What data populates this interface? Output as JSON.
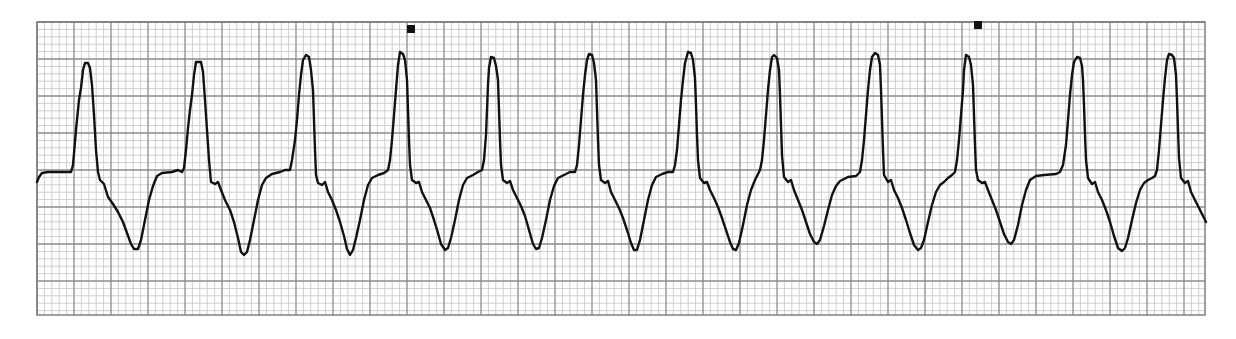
{
  "chart_data": {
    "type": "line",
    "title": "",
    "subtitle": "",
    "xlabel": "",
    "ylabel": "",
    "grid": {
      "on": true,
      "x0": 37,
      "y0": 22,
      "x1": 1205,
      "y1": 315,
      "minor_px": 7.4,
      "major_px": 37,
      "minor_color": "#c4c4c4",
      "major_color": "#8c8c8c",
      "border_color": "#777777"
    },
    "trace_color": "#111111",
    "trace_width": 2.4,
    "markers": [
      {
        "x": 411,
        "y": 29,
        "label": "event-marker-1"
      },
      {
        "x": 978,
        "y": 25,
        "label": "event-marker-2"
      }
    ],
    "complexes": [
      {
        "index": 1,
        "peak": [
          86,
          63
        ],
        "trough": [
          134,
          250
        ]
      },
      {
        "index": 2,
        "peak": [
          198,
          62
        ],
        "trough": [
          243,
          255
        ]
      },
      {
        "index": 3,
        "peak": [
          306,
          55
        ],
        "trough": [
          350,
          255
        ]
      },
      {
        "index": 4,
        "peak": [
          400,
          52
        ],
        "trough": [
          446,
          250
        ]
      },
      {
        "index": 5,
        "peak": [
          490,
          57
        ],
        "trough": [
          537,
          250
        ]
      },
      {
        "index": 6,
        "peak": [
          589,
          54
        ],
        "trough": [
          635,
          251
        ]
      },
      {
        "index": 7,
        "peak": [
          689,
          52
        ],
        "trough": [
          735,
          250
        ]
      },
      {
        "index": 8,
        "peak": [
          773,
          55
        ],
        "trough": [
          817,
          244
        ]
      },
      {
        "index": 9,
        "peak": [
          874,
          53
        ],
        "trough": [
          918,
          250
        ]
      },
      {
        "index": 10,
        "peak": [
          966,
          55
        ],
        "trough": [
          1010,
          244
        ]
      },
      {
        "index": 11,
        "peak": [
          1076,
          57
        ],
        "trough": [
          1122,
          251
        ]
      },
      {
        "index": 12,
        "peak": [
          1169,
          54
        ],
        "trough": null
      }
    ],
    "points": [
      [
        37,
        182
      ],
      [
        39,
        177
      ],
      [
        42,
        173
      ],
      [
        48,
        172
      ],
      [
        71,
        172
      ],
      [
        73,
        165
      ],
      [
        76,
        130
      ],
      [
        79,
        100
      ],
      [
        81,
        88
      ],
      [
        83,
        70
      ],
      [
        85,
        63
      ],
      [
        88,
        63
      ],
      [
        90,
        68
      ],
      [
        92,
        85
      ],
      [
        94,
        115
      ],
      [
        96,
        150
      ],
      [
        98,
        172
      ],
      [
        100,
        180
      ],
      [
        104,
        184
      ],
      [
        108,
        197
      ],
      [
        113,
        204
      ],
      [
        118,
        212
      ],
      [
        123,
        222
      ],
      [
        127,
        233
      ],
      [
        131,
        244
      ],
      [
        134,
        249
      ],
      [
        138,
        249
      ],
      [
        141,
        240
      ],
      [
        145,
        220
      ],
      [
        149,
        200
      ],
      [
        153,
        186
      ],
      [
        157,
        176
      ],
      [
        162,
        173
      ],
      [
        172,
        172
      ],
      [
        178,
        170
      ],
      [
        182,
        172
      ],
      [
        184,
        168
      ],
      [
        186,
        150
      ],
      [
        188,
        128
      ],
      [
        190,
        110
      ],
      [
        192,
        95
      ],
      [
        194,
        75
      ],
      [
        196,
        62
      ],
      [
        201,
        62
      ],
      [
        203,
        72
      ],
      [
        205,
        100
      ],
      [
        207,
        130
      ],
      [
        209,
        160
      ],
      [
        211,
        182
      ],
      [
        215,
        184
      ],
      [
        218,
        182
      ],
      [
        221,
        190
      ],
      [
        225,
        200
      ],
      [
        230,
        210
      ],
      [
        234,
        222
      ],
      [
        238,
        238
      ],
      [
        241,
        252
      ],
      [
        244,
        255
      ],
      [
        247,
        252
      ],
      [
        250,
        240
      ],
      [
        254,
        220
      ],
      [
        258,
        200
      ],
      [
        262,
        185
      ],
      [
        266,
        178
      ],
      [
        272,
        174
      ],
      [
        280,
        172
      ],
      [
        285,
        170
      ],
      [
        290,
        170
      ],
      [
        292,
        160
      ],
      [
        295,
        140
      ],
      [
        297,
        120
      ],
      [
        299,
        95
      ],
      [
        301,
        75
      ],
      [
        303,
        60
      ],
      [
        306,
        55
      ],
      [
        309,
        57
      ],
      [
        311,
        70
      ],
      [
        313,
        90
      ],
      [
        314,
        120
      ],
      [
        315,
        150
      ],
      [
        316,
        175
      ],
      [
        318,
        183
      ],
      [
        322,
        185
      ],
      [
        325,
        182
      ],
      [
        328,
        192
      ],
      [
        332,
        200
      ],
      [
        336,
        210
      ],
      [
        340,
        222
      ],
      [
        344,
        236
      ],
      [
        347,
        249
      ],
      [
        350,
        255
      ],
      [
        353,
        250
      ],
      [
        356,
        238
      ],
      [
        360,
        220
      ],
      [
        364,
        200
      ],
      [
        368,
        185
      ],
      [
        372,
        178
      ],
      [
        378,
        175
      ],
      [
        384,
        173
      ],
      [
        388,
        170
      ],
      [
        390,
        160
      ],
      [
        392,
        140
      ],
      [
        394,
        115
      ],
      [
        396,
        90
      ],
      [
        398,
        65
      ],
      [
        400,
        52
      ],
      [
        403,
        54
      ],
      [
        405,
        60
      ],
      [
        407,
        80
      ],
      [
        408,
        110
      ],
      [
        409,
        140
      ],
      [
        410,
        165
      ],
      [
        412,
        180
      ],
      [
        416,
        183
      ],
      [
        419,
        182
      ],
      [
        422,
        192
      ],
      [
        426,
        200
      ],
      [
        430,
        208
      ],
      [
        434,
        220
      ],
      [
        438,
        233
      ],
      [
        441,
        244
      ],
      [
        445,
        250
      ],
      [
        448,
        248
      ],
      [
        451,
        238
      ],
      [
        455,
        220
      ],
      [
        459,
        200
      ],
      [
        463,
        185
      ],
      [
        467,
        178
      ],
      [
        473,
        175
      ],
      [
        478,
        172
      ],
      [
        482,
        170
      ],
      [
        484,
        160
      ],
      [
        486,
        135
      ],
      [
        487,
        110
      ],
      [
        488,
        85
      ],
      [
        489,
        68
      ],
      [
        491,
        57
      ],
      [
        494,
        58
      ],
      [
        496,
        66
      ],
      [
        498,
        80
      ],
      [
        499,
        110
      ],
      [
        500,
        140
      ],
      [
        501,
        165
      ],
      [
        503,
        180
      ],
      [
        507,
        183
      ],
      [
        510,
        181
      ],
      [
        513,
        190
      ],
      [
        517,
        198
      ],
      [
        521,
        206
      ],
      [
        525,
        216
      ],
      [
        529,
        230
      ],
      [
        533,
        244
      ],
      [
        536,
        249
      ],
      [
        539,
        248
      ],
      [
        542,
        238
      ],
      [
        546,
        220
      ],
      [
        550,
        200
      ],
      [
        554,
        186
      ],
      [
        558,
        178
      ],
      [
        564,
        175
      ],
      [
        570,
        172
      ],
      [
        575,
        172
      ],
      [
        577,
        165
      ],
      [
        579,
        145
      ],
      [
        581,
        120
      ],
      [
        583,
        95
      ],
      [
        585,
        75
      ],
      [
        587,
        60
      ],
      [
        589,
        54
      ],
      [
        592,
        55
      ],
      [
        594,
        63
      ],
      [
        596,
        80
      ],
      [
        597,
        110
      ],
      [
        598,
        140
      ],
      [
        599,
        165
      ],
      [
        601,
        180
      ],
      [
        605,
        183
      ],
      [
        608,
        181
      ],
      [
        611,
        192
      ],
      [
        615,
        200
      ],
      [
        619,
        208
      ],
      [
        623,
        218
      ],
      [
        627,
        230
      ],
      [
        631,
        243
      ],
      [
        634,
        250
      ],
      [
        637,
        250
      ],
      [
        640,
        240
      ],
      [
        644,
        220
      ],
      [
        648,
        200
      ],
      [
        652,
        185
      ],
      [
        656,
        177
      ],
      [
        662,
        174
      ],
      [
        668,
        172
      ],
      [
        673,
        172
      ],
      [
        675,
        165
      ],
      [
        677,
        150
      ],
      [
        679,
        125
      ],
      [
        681,
        100
      ],
      [
        683,
        80
      ],
      [
        685,
        63
      ],
      [
        688,
        52
      ],
      [
        691,
        53
      ],
      [
        693,
        60
      ],
      [
        695,
        78
      ],
      [
        696,
        105
      ],
      [
        697,
        135
      ],
      [
        698,
        160
      ],
      [
        700,
        178
      ],
      [
        704,
        183
      ],
      [
        707,
        182
      ],
      [
        710,
        190
      ],
      [
        714,
        198
      ],
      [
        718,
        207
      ],
      [
        722,
        218
      ],
      [
        726,
        230
      ],
      [
        730,
        242
      ],
      [
        733,
        249
      ],
      [
        736,
        250
      ],
      [
        739,
        243
      ],
      [
        743,
        225
      ],
      [
        747,
        205
      ],
      [
        751,
        190
      ],
      [
        755,
        180
      ],
      [
        757,
        176
      ],
      [
        760,
        170
      ],
      [
        762,
        160
      ],
      [
        764,
        140
      ],
      [
        766,
        115
      ],
      [
        768,
        90
      ],
      [
        770,
        70
      ],
      [
        772,
        57
      ],
      [
        774,
        55
      ],
      [
        777,
        58
      ],
      [
        779,
        70
      ],
      [
        780,
        95
      ],
      [
        781,
        125
      ],
      [
        782,
        155
      ],
      [
        784,
        177
      ],
      [
        788,
        182
      ],
      [
        791,
        180
      ],
      [
        794,
        190
      ],
      [
        798,
        200
      ],
      [
        802,
        210
      ],
      [
        806,
        222
      ],
      [
        810,
        234
      ],
      [
        814,
        242
      ],
      [
        817,
        244
      ],
      [
        820,
        240
      ],
      [
        824,
        226
      ],
      [
        828,
        210
      ],
      [
        832,
        195
      ],
      [
        836,
        186
      ],
      [
        840,
        181
      ],
      [
        848,
        177
      ],
      [
        856,
        176
      ],
      [
        860,
        172
      ],
      [
        862,
        160
      ],
      [
        864,
        140
      ],
      [
        866,
        115
      ],
      [
        868,
        90
      ],
      [
        870,
        70
      ],
      [
        872,
        57
      ],
      [
        875,
        53
      ],
      [
        878,
        55
      ],
      [
        880,
        65
      ],
      [
        881,
        90
      ],
      [
        882,
        120
      ],
      [
        883,
        150
      ],
      [
        884,
        175
      ],
      [
        888,
        182
      ],
      [
        891,
        180
      ],
      [
        894,
        190
      ],
      [
        898,
        198
      ],
      [
        902,
        208
      ],
      [
        906,
        220
      ],
      [
        910,
        233
      ],
      [
        914,
        245
      ],
      [
        918,
        250
      ],
      [
        921,
        248
      ],
      [
        924,
        240
      ],
      [
        928,
        222
      ],
      [
        932,
        205
      ],
      [
        936,
        192
      ],
      [
        940,
        185
      ],
      [
        944,
        182
      ],
      [
        948,
        178
      ],
      [
        952,
        175
      ],
      [
        955,
        172
      ],
      [
        957,
        160
      ],
      [
        959,
        140
      ],
      [
        961,
        115
      ],
      [
        963,
        90
      ],
      [
        964,
        70
      ],
      [
        966,
        55
      ],
      [
        969,
        57
      ],
      [
        971,
        65
      ],
      [
        973,
        85
      ],
      [
        974,
        115
      ],
      [
        975,
        145
      ],
      [
        976,
        170
      ],
      [
        978,
        180
      ],
      [
        982,
        183
      ],
      [
        985,
        182
      ],
      [
        988,
        190
      ],
      [
        992,
        200
      ],
      [
        996,
        210
      ],
      [
        1000,
        222
      ],
      [
        1004,
        234
      ],
      [
        1008,
        242
      ],
      [
        1011,
        244
      ],
      [
        1014,
        240
      ],
      [
        1018,
        225
      ],
      [
        1022,
        205
      ],
      [
        1026,
        190
      ],
      [
        1030,
        180
      ],
      [
        1036,
        176
      ],
      [
        1044,
        175
      ],
      [
        1056,
        174
      ],
      [
        1060,
        172
      ],
      [
        1063,
        165
      ],
      [
        1066,
        145
      ],
      [
        1068,
        120
      ],
      [
        1070,
        95
      ],
      [
        1072,
        75
      ],
      [
        1074,
        62
      ],
      [
        1077,
        57
      ],
      [
        1080,
        58
      ],
      [
        1082,
        66
      ],
      [
        1083,
        80
      ],
      [
        1084,
        105
      ],
      [
        1085,
        135
      ],
      [
        1086,
        160
      ],
      [
        1088,
        178
      ],
      [
        1092,
        184
      ],
      [
        1095,
        182
      ],
      [
        1098,
        192
      ],
      [
        1102,
        200
      ],
      [
        1106,
        210
      ],
      [
        1110,
        222
      ],
      [
        1114,
        236
      ],
      [
        1118,
        248
      ],
      [
        1122,
        251
      ],
      [
        1125,
        248
      ],
      [
        1128,
        238
      ],
      [
        1132,
        220
      ],
      [
        1136,
        203
      ],
      [
        1140,
        190
      ],
      [
        1144,
        183
      ],
      [
        1148,
        180
      ],
      [
        1152,
        178
      ],
      [
        1155,
        176
      ],
      [
        1157,
        170
      ],
      [
        1159,
        150
      ],
      [
        1161,
        125
      ],
      [
        1163,
        100
      ],
      [
        1165,
        78
      ],
      [
        1167,
        60
      ],
      [
        1169,
        54
      ],
      [
        1172,
        55
      ],
      [
        1174,
        58
      ],
      [
        1176,
        75
      ],
      [
        1177,
        100
      ],
      [
        1178,
        130
      ],
      [
        1179,
        158
      ],
      [
        1181,
        178
      ],
      [
        1185,
        183
      ],
      [
        1188,
        181
      ],
      [
        1191,
        192
      ],
      [
        1195,
        200
      ],
      [
        1199,
        208
      ],
      [
        1203,
        216
      ],
      [
        1206,
        222
      ]
    ],
    "x_range": [
      37,
      1206
    ],
    "y_range": [
      22,
      315
    ],
    "legend": null
  }
}
